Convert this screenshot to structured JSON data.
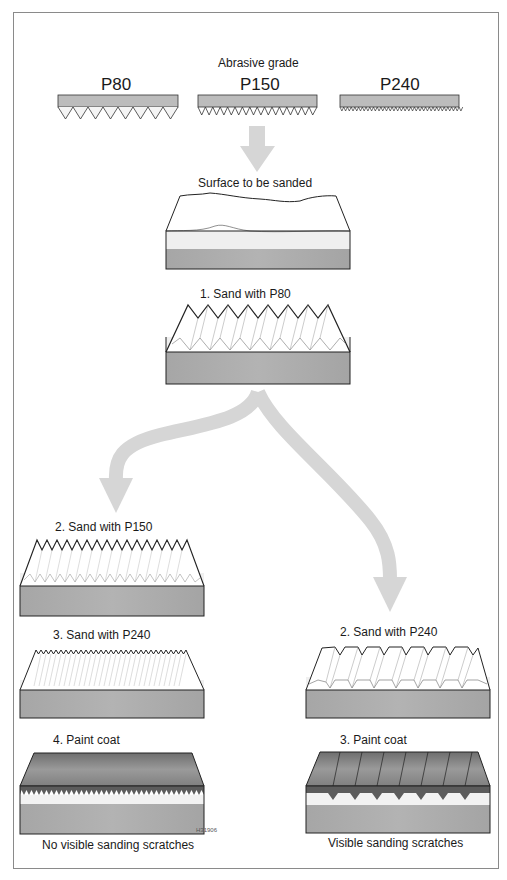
{
  "title": "Abrasive grade",
  "grades": [
    {
      "label": "P80",
      "teeth": 8
    },
    {
      "label": "P150",
      "teeth": 16
    },
    {
      "label": "P240",
      "teeth": 32
    }
  ],
  "stages": {
    "surface": "Surface to be sanded",
    "step1": "1. Sand with P80",
    "left": {
      "step2": "2. Sand with P150",
      "step3": "3. Sand with P240",
      "step4": "4. Paint coat",
      "result": "No visible sanding scratches"
    },
    "right": {
      "step2": "2. Sand with P240",
      "step3": "3. Paint coat",
      "result": "Visible sanding scratches"
    }
  },
  "figure_code": "H31906",
  "colors": {
    "arrow": "#d6d6d6",
    "abrasive_backing": "#b8b8b8",
    "substrate": "#a9a9a9",
    "filler": "#eeeeee",
    "paint": "#7a7a7a",
    "outline": "#222222"
  }
}
